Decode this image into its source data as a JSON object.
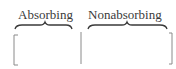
{
  "partition": {
    "columns": [
      {
        "label": "Absorbing"
      },
      {
        "label": "Nonabsorbing"
      }
    ]
  },
  "colors": {
    "ink": "#3a3a3a",
    "bracket": "#8a8a8a"
  }
}
